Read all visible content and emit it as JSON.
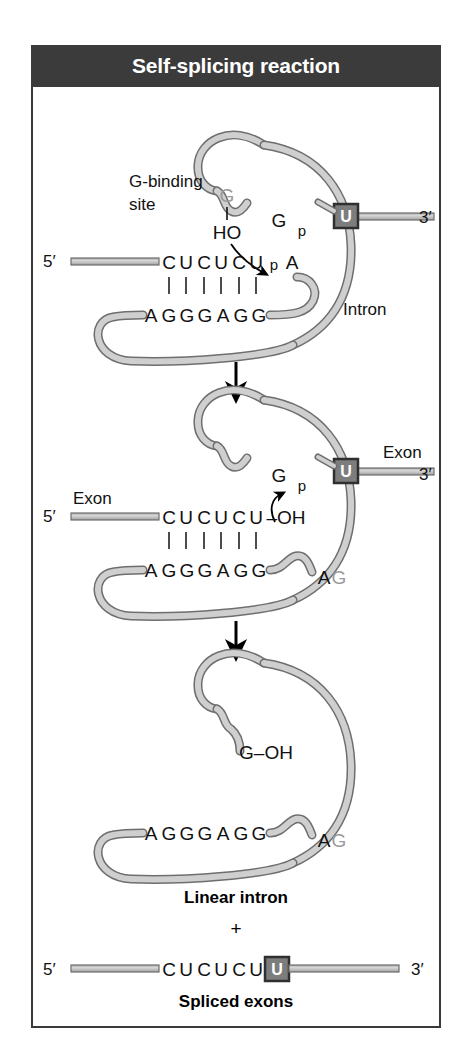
{
  "figure": {
    "title": "Self-splicing reaction",
    "title_bg": "#3b3b3b",
    "title_color": "#ffffff",
    "frame_border_color": "#3a3a3a",
    "rna_fill": "#c9c9c9",
    "rna_stroke": "#6e6e6e",
    "gray_text_color": "#9a9a9a",
    "ubox_bg": "#7d7d7d",
    "ubox_border": "#2f2f2f"
  },
  "steps": [
    {
      "id": "step-1",
      "labels": {
        "g_binding_site_line1": "G-binding",
        "g_binding_site_line2": "site",
        "bound_g": "G",
        "hydroxyl": "HO",
        "intron_g": "G",
        "phosphate_left": "p",
        "u_box": "U",
        "five_prime": "5′",
        "three_prime": "3′",
        "branch_p": "p",
        "branch_a": "A",
        "intron": "Intron"
      },
      "top_strand_bases": [
        "C",
        "U",
        "C",
        "U",
        "C",
        "U"
      ],
      "bottom_strand_bases": [
        "A",
        "G",
        "G",
        "G",
        "A",
        "G",
        "G"
      ],
      "base_pair_count": 6
    },
    {
      "id": "step-2",
      "labels": {
        "intron_g": "G",
        "phosphate_left": "p",
        "u_box": "U",
        "exon_left": "Exon",
        "exon_right": "Exon",
        "five_prime": "5′",
        "three_prime": "3′",
        "free_hydroxyl": "–OH",
        "intron_end_a": "A",
        "intron_end_g": "G"
      },
      "top_strand_bases": [
        "C",
        "U",
        "C",
        "U",
        "C",
        "U"
      ],
      "bottom_strand_bases": [
        "A",
        "G",
        "G",
        "G",
        "A",
        "G",
        "G"
      ],
      "base_pair_count": 6
    },
    {
      "id": "step-3",
      "labels": {
        "g_hydroxyl": "G–OH",
        "intron_end_a": "A",
        "intron_end_g": "G"
      },
      "bottom_strand_bases": [
        "A",
        "G",
        "G",
        "G",
        "A",
        "G",
        "G"
      ]
    }
  ],
  "products": {
    "linear_intron_label": "Linear intron",
    "plus_sign": "+",
    "spliced_exons_label": "Spliced exons",
    "spliced": {
      "five_prime": "5′",
      "three_prime": "3′",
      "bases": [
        "C",
        "U",
        "C",
        "U",
        "C",
        "U"
      ],
      "u_box": "U"
    }
  },
  "arrows": [
    {
      "id": "arrow-step1-to-step2"
    },
    {
      "id": "arrow-step2-to-step3"
    }
  ]
}
